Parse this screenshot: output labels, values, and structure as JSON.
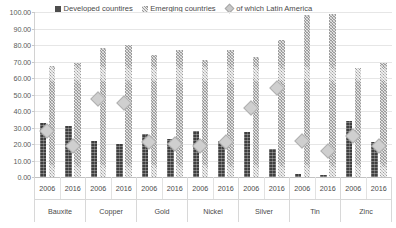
{
  "chart_data": {
    "type": "bar",
    "title": "",
    "subtitle": "",
    "xlabel": "",
    "ylabel": "",
    "ylim": [
      0,
      100
    ],
    "ytick_step": 10,
    "grid": true,
    "legend_position": "top-left",
    "categories": [
      "Bauxite 2006",
      "Bauxite 2016",
      "Copper 2006",
      "Copper 2016",
      "Gold 2006",
      "Gold 2016",
      "Nickel 2006",
      "Nickel 2016",
      "Silver 2006",
      "Silver 2016",
      "Tin 2006",
      "Tin 2016",
      "Zinc 2006",
      "Zinc 2016"
    ],
    "groups": [
      {
        "name": "Bauxite",
        "years": [
          "2006",
          "2016"
        ]
      },
      {
        "name": "Copper",
        "years": [
          "2006",
          "2016"
        ]
      },
      {
        "name": "Gold",
        "years": [
          "2006",
          "2016"
        ]
      },
      {
        "name": "Nickel",
        "years": [
          "2006",
          "2016"
        ]
      },
      {
        "name": "Silver",
        "years": [
          "2006",
          "2016"
        ]
      },
      {
        "name": "Tin",
        "years": [
          "2006",
          "2016"
        ]
      },
      {
        "name": "Zinc",
        "years": [
          "2006",
          "2016"
        ]
      }
    ],
    "ytick_labels": [
      "100.00",
      "90.00",
      "80.00",
      "70.00",
      "60.00",
      "50.00",
      "40.00",
      "30.00",
      "20.00",
      "10.00",
      "0.00"
    ],
    "series": [
      {
        "name": "Developed countires",
        "key": "developed",
        "type": "bar",
        "color": "#3f3f3f",
        "values": [
          33,
          31,
          22,
          20,
          26,
          23,
          28,
          22,
          27,
          17,
          2,
          1,
          34,
          21
        ]
      },
      {
        "name": "Emerging countries",
        "key": "emerging",
        "type": "bar",
        "color": "#9c9c9c",
        "values": [
          67,
          69,
          78,
          80,
          74,
          77,
          71,
          77,
          73,
          83,
          98,
          99,
          66,
          69
        ]
      },
      {
        "name": "of which Latin America",
        "key": "latin_america",
        "type": "marker",
        "marker": "diamond",
        "color": "#cfcfcf",
        "values": [
          28,
          19,
          47,
          45,
          21,
          20,
          19,
          21,
          42,
          54,
          22,
          16,
          25,
          19
        ]
      }
    ]
  },
  "legend": {
    "items": [
      {
        "label": "Developed countires",
        "marker": "square-dark"
      },
      {
        "label": "Emerging countries",
        "marker": "square-hatched"
      },
      {
        "label": "of which Latin America",
        "marker": "diamond"
      }
    ]
  }
}
